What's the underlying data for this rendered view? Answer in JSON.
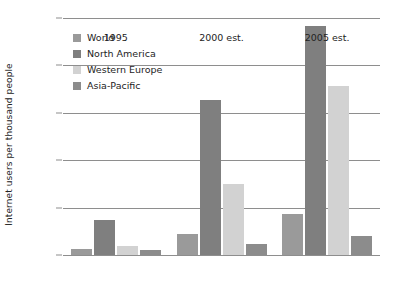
{
  "chart_data": {
    "type": "bar",
    "title": "",
    "xlabel": "",
    "ylabel": "Internet users per thousand people",
    "categories": [
      "1995",
      "2000 est.",
      "2005 est."
    ],
    "series": [
      {
        "name": "World",
        "color": "#9a9a9a",
        "values": [
          20,
          65,
          130
        ]
      },
      {
        "name": "North America",
        "color": "#7f7f7f",
        "values": [
          112,
          490,
          725
        ]
      },
      {
        "name": "Western Europe",
        "color": "#d2d2d2",
        "values": [
          28,
          225,
          535
        ]
      },
      {
        "name": "Asia-Pacific",
        "color": "#8c8c8c",
        "values": [
          15,
          35,
          60
        ]
      }
    ],
    "ylim": [
      0,
      750
    ],
    "yticks": [
      0,
      150,
      300,
      450,
      600,
      750
    ],
    "ytick_labels": [
      "0",
      "150",
      "300",
      "450",
      "600",
      "750"
    ],
    "grid": true,
    "legend_position": "upper-left-inside",
    "axis_color": "#8e8e8e"
  }
}
